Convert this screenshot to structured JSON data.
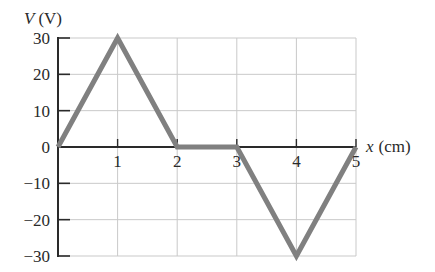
{
  "chart_data": {
    "type": "line",
    "title": "",
    "xlabel": "x (cm)",
    "ylabel": "V (V)",
    "ylabel_var": "V",
    "ylabel_unit": "(V)",
    "xlabel_var": "x",
    "xlabel_unit": "(cm)",
    "x": [
      0,
      1,
      2,
      3,
      4,
      5
    ],
    "series": [
      {
        "name": "V(x)",
        "values": [
          0,
          30,
          0,
          0,
          -30,
          0
        ],
        "color": "#808080"
      }
    ],
    "xlim": [
      0,
      5
    ],
    "ylim": [
      -30,
      30
    ],
    "x_ticks": [
      1,
      2,
      3,
      4,
      5
    ],
    "x_tick_labels": [
      "1",
      "2",
      "3",
      "4",
      "5"
    ],
    "y_ticks": [
      30,
      20,
      10,
      0,
      -10,
      -20,
      -30
    ],
    "y_tick_labels": [
      "30",
      "20",
      "10",
      "0",
      "−10",
      "−20",
      "−30"
    ],
    "grid": true,
    "legend": null
  }
}
